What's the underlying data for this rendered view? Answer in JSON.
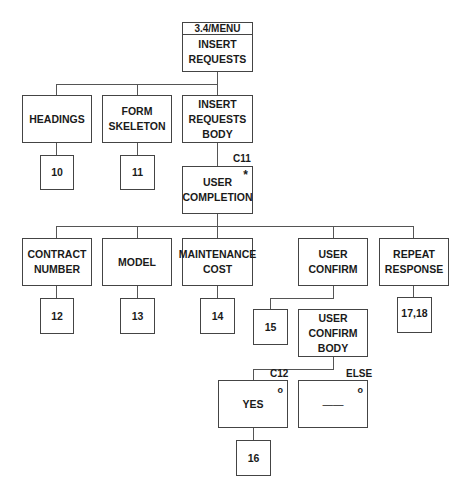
{
  "root": {
    "header": "3.4/MENU",
    "label": "INSERT\nREQUESTS"
  },
  "level1": [
    {
      "label": "HEADINGS",
      "ref": "10"
    },
    {
      "label": "FORM\nSKELETON",
      "ref": "11"
    },
    {
      "label": "INSERT\nREQUESTS\nBODY"
    }
  ],
  "user_completion": {
    "condition": "C11",
    "marker": "*",
    "label": "USER\nCOMPLETION"
  },
  "level3": [
    {
      "label": "CONTRACT\nNUMBER",
      "ref": "12"
    },
    {
      "label": "MODEL",
      "ref": "13"
    },
    {
      "label": "MAINTENANCE\nCOST",
      "ref": "14"
    },
    {
      "label": "USER\nCONFIRM",
      "ref": "15"
    },
    {
      "label": "REPEAT\nRESPONSE",
      "ref": "17,18"
    }
  ],
  "confirm_body": {
    "label": "USER\nCONFIRM\nBODY"
  },
  "branches": [
    {
      "condition": "C12",
      "marker": "o",
      "label": "YES",
      "ref": "16"
    },
    {
      "condition": "ELSE",
      "marker": "o",
      "label": "——"
    }
  ]
}
